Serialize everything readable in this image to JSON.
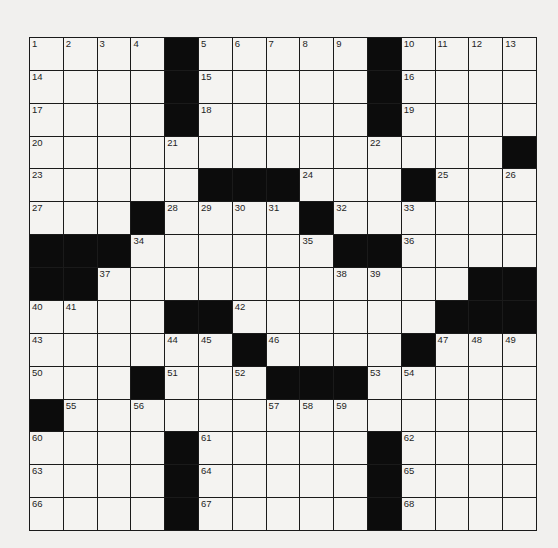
{
  "puzzle": {
    "rows": 15,
    "cols": 15,
    "colors": {
      "block": "#0c0c0c",
      "cell": "#f4f3f1",
      "line": "#1a1a1a",
      "background": "#f1f0ee"
    },
    "grid": [
      [
        "1",
        "2",
        "3",
        "4",
        "#",
        "5",
        "6",
        "7",
        "8",
        "9",
        "#",
        "10",
        "11",
        "12",
        "13"
      ],
      [
        "14",
        ".",
        ".",
        ".",
        "#",
        "15",
        ".",
        ".",
        ".",
        ".",
        "#",
        "16",
        ".",
        ".",
        "."
      ],
      [
        "17",
        ".",
        ".",
        ".",
        "#",
        "18",
        ".",
        ".",
        ".",
        ".",
        "#",
        "19",
        ".",
        ".",
        "."
      ],
      [
        "20",
        ".",
        ".",
        ".",
        "21",
        ".",
        ".",
        ".",
        ".",
        ".",
        "22",
        ".",
        ".",
        ".",
        "#"
      ],
      [
        "23",
        ".",
        ".",
        ".",
        ".",
        "#",
        "#",
        "#",
        "24",
        ".",
        ".",
        "#",
        "25",
        ".",
        "26"
      ],
      [
        "27",
        ".",
        ".",
        "#",
        "28",
        "29",
        "30",
        "31",
        "#",
        "32",
        ".",
        "33",
        ".",
        ".",
        "."
      ],
      [
        "#",
        "#",
        "#",
        "34",
        ".",
        ".",
        ".",
        ".",
        "35",
        "#",
        "#",
        "36",
        ".",
        ".",
        "."
      ],
      [
        "#",
        "#",
        "37",
        ".",
        ".",
        ".",
        ".",
        ".",
        ".",
        "38",
        "39",
        ".",
        ".",
        "#",
        "#"
      ],
      [
        "40",
        "41",
        ".",
        ".",
        "#",
        "#",
        "42",
        ".",
        ".",
        ".",
        ".",
        ".",
        "#",
        "#",
        "#"
      ],
      [
        "43",
        ".",
        ".",
        ".",
        "44",
        "45",
        "#",
        "46",
        ".",
        ".",
        ".",
        "#",
        "47",
        "48",
        "49"
      ],
      [
        "50",
        ".",
        ".",
        "#",
        "51",
        ".",
        "52",
        "#",
        "#",
        "#",
        "53",
        "54",
        ".",
        ".",
        "."
      ],
      [
        "#",
        "55",
        ".",
        "56",
        ".",
        ".",
        ".",
        "57",
        "58",
        "59",
        ".",
        ".",
        ".",
        ".",
        "."
      ],
      [
        "60",
        ".",
        ".",
        ".",
        "#",
        "61",
        ".",
        ".",
        ".",
        ".",
        "#",
        "62",
        ".",
        ".",
        "."
      ],
      [
        "63",
        ".",
        ".",
        ".",
        "#",
        "64",
        ".",
        ".",
        ".",
        ".",
        "#",
        "65",
        ".",
        ".",
        "."
      ],
      [
        "66",
        ".",
        ".",
        ".",
        "#",
        "67",
        ".",
        ".",
        ".",
        ".",
        "#",
        "68",
        ".",
        ".",
        "."
      ]
    ]
  }
}
